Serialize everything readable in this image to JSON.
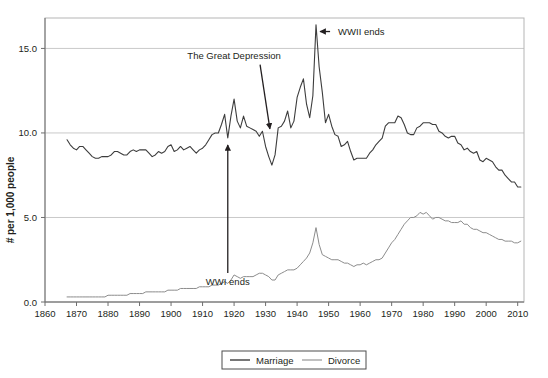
{
  "chart_data": {
    "type": "line",
    "title": "",
    "subtitle": "",
    "xlabel": "",
    "ylabel": "# per 1,000 people",
    "xlim": [
      1860,
      2012
    ],
    "ylim": [
      0.0,
      16.8
    ],
    "grid": true,
    "legend_position": "bottom-center",
    "x_ticks": [
      1860,
      1870,
      1880,
      1890,
      1900,
      1910,
      1920,
      1930,
      1940,
      1950,
      1960,
      1970,
      1980,
      1990,
      2000,
      2010
    ],
    "x_tick_labels": [
      "1860",
      "1870",
      "1880",
      "1890",
      "1900",
      "1910",
      "1920",
      "1930",
      "1940",
      "1950",
      "1960",
      "1970",
      "1980",
      "1990",
      "2000",
      "2010"
    ],
    "y_ticks": [
      0.0,
      5.0,
      10.0,
      15.0
    ],
    "y_tick_labels": [
      "0.0",
      "5.0",
      "10.0",
      "15.0"
    ],
    "legend": [
      "Marriage",
      "Divorce"
    ],
    "colors": {
      "marriage": "#3d3d3d",
      "divorce": "#8c8c8c",
      "gridline": "#c9c9c9",
      "text": "#231f20",
      "plot_border": "#b5b5b5"
    },
    "series": [
      {
        "name": "Marriage",
        "color": "#3d3d3d",
        "x": [
          1867,
          1868,
          1869,
          1870,
          1871,
          1872,
          1873,
          1874,
          1875,
          1876,
          1877,
          1878,
          1879,
          1880,
          1881,
          1882,
          1883,
          1884,
          1885,
          1886,
          1887,
          1888,
          1889,
          1890,
          1891,
          1892,
          1893,
          1894,
          1895,
          1896,
          1897,
          1898,
          1899,
          1900,
          1901,
          1902,
          1903,
          1904,
          1905,
          1906,
          1907,
          1908,
          1909,
          1910,
          1911,
          1912,
          1913,
          1914,
          1915,
          1916,
          1917,
          1918,
          1919,
          1920,
          1921,
          1922,
          1923,
          1924,
          1925,
          1926,
          1927,
          1928,
          1929,
          1930,
          1931,
          1932,
          1933,
          1934,
          1935,
          1936,
          1937,
          1938,
          1939,
          1940,
          1941,
          1942,
          1943,
          1944,
          1945,
          1946,
          1947,
          1948,
          1949,
          1950,
          1951,
          1952,
          1953,
          1954,
          1955,
          1956,
          1957,
          1958,
          1959,
          1960,
          1961,
          1962,
          1963,
          1964,
          1965,
          1966,
          1967,
          1968,
          1969,
          1970,
          1971,
          1972,
          1973,
          1974,
          1975,
          1976,
          1977,
          1978,
          1979,
          1980,
          1981,
          1982,
          1983,
          1984,
          1985,
          1986,
          1987,
          1988,
          1989,
          1990,
          1991,
          1992,
          1993,
          1994,
          1995,
          1996,
          1997,
          1998,
          1999,
          2000,
          2001,
          2002,
          2003,
          2004,
          2005,
          2006,
          2007,
          2008,
          2009,
          2010,
          2011
        ],
        "values": [
          9.6,
          9.3,
          9.1,
          9.0,
          9.2,
          9.2,
          9.0,
          8.8,
          8.6,
          8.5,
          8.5,
          8.6,
          8.6,
          8.6,
          8.7,
          8.9,
          8.9,
          8.8,
          8.7,
          8.7,
          8.9,
          9.0,
          8.9,
          9.0,
          9.0,
          9.0,
          8.8,
          8.6,
          8.7,
          8.9,
          8.8,
          8.9,
          9.2,
          9.3,
          8.9,
          9.0,
          9.2,
          9.0,
          9.1,
          9.2,
          9.0,
          8.8,
          9.0,
          9.1,
          9.3,
          9.6,
          9.9,
          10.0,
          10.0,
          10.5,
          11.1,
          9.7,
          11.0,
          12.0,
          10.7,
          10.3,
          11.0,
          10.4,
          10.3,
          10.2,
          10.1,
          9.8,
          10.1,
          9.2,
          8.6,
          8.1,
          8.7,
          10.3,
          10.4,
          10.7,
          11.3,
          10.3,
          10.7,
          12.1,
          12.7,
          13.2,
          11.7,
          10.9,
          12.2,
          16.4,
          13.9,
          12.4,
          10.6,
          11.1,
          10.4,
          9.9,
          9.8,
          9.2,
          9.3,
          9.5,
          8.9,
          8.4,
          8.5,
          8.5,
          8.5,
          8.5,
          8.8,
          9.0,
          9.3,
          9.5,
          9.7,
          10.4,
          10.6,
          10.6,
          10.6,
          11.0,
          10.9,
          10.5,
          10.0,
          9.9,
          9.9,
          10.3,
          10.4,
          10.6,
          10.6,
          10.6,
          10.5,
          10.5,
          10.1,
          10.0,
          9.8,
          9.7,
          9.8,
          9.8,
          9.4,
          9.3,
          9.0,
          9.1,
          8.9,
          8.8,
          8.9,
          8.4,
          8.3,
          8.5,
          8.4,
          8.3,
          8.0,
          7.8,
          7.8,
          7.5,
          7.3,
          7.1,
          7.1,
          6.8,
          6.8
        ]
      },
      {
        "name": "Divorce",
        "color": "#8c8c8c",
        "x": [
          1867,
          1868,
          1869,
          1870,
          1871,
          1872,
          1873,
          1874,
          1875,
          1876,
          1877,
          1878,
          1879,
          1880,
          1881,
          1882,
          1883,
          1884,
          1885,
          1886,
          1887,
          1888,
          1889,
          1890,
          1891,
          1892,
          1893,
          1894,
          1895,
          1896,
          1897,
          1898,
          1899,
          1900,
          1901,
          1902,
          1903,
          1904,
          1905,
          1906,
          1907,
          1908,
          1909,
          1910,
          1911,
          1912,
          1913,
          1914,
          1915,
          1916,
          1917,
          1918,
          1919,
          1920,
          1921,
          1922,
          1923,
          1924,
          1925,
          1926,
          1927,
          1928,
          1929,
          1930,
          1931,
          1932,
          1933,
          1934,
          1935,
          1936,
          1937,
          1938,
          1939,
          1940,
          1941,
          1942,
          1943,
          1944,
          1945,
          1946,
          1947,
          1948,
          1949,
          1950,
          1951,
          1952,
          1953,
          1954,
          1955,
          1956,
          1957,
          1958,
          1959,
          1960,
          1961,
          1962,
          1963,
          1964,
          1965,
          1966,
          1967,
          1968,
          1969,
          1970,
          1971,
          1972,
          1973,
          1974,
          1975,
          1976,
          1977,
          1978,
          1979,
          1980,
          1981,
          1982,
          1983,
          1984,
          1985,
          1986,
          1987,
          1988,
          1989,
          1990,
          1991,
          1992,
          1993,
          1994,
          1995,
          1996,
          1997,
          1998,
          1999,
          2000,
          2001,
          2002,
          2003,
          2004,
          2005,
          2006,
          2007,
          2008,
          2009,
          2010,
          2011
        ],
        "values": [
          0.3,
          0.3,
          0.3,
          0.3,
          0.3,
          0.3,
          0.3,
          0.3,
          0.3,
          0.3,
          0.3,
          0.3,
          0.3,
          0.4,
          0.4,
          0.4,
          0.4,
          0.4,
          0.4,
          0.4,
          0.5,
          0.5,
          0.5,
          0.5,
          0.5,
          0.6,
          0.6,
          0.6,
          0.6,
          0.6,
          0.6,
          0.6,
          0.7,
          0.7,
          0.7,
          0.7,
          0.8,
          0.8,
          0.8,
          0.8,
          0.8,
          0.8,
          0.9,
          0.9,
          0.9,
          0.9,
          1.0,
          1.0,
          1.0,
          1.1,
          1.2,
          1.1,
          1.3,
          1.6,
          1.5,
          1.4,
          1.5,
          1.5,
          1.5,
          1.5,
          1.6,
          1.7,
          1.7,
          1.6,
          1.5,
          1.3,
          1.3,
          1.6,
          1.7,
          1.8,
          1.9,
          1.9,
          1.9,
          2.0,
          2.2,
          2.4,
          2.6,
          2.9,
          3.5,
          4.4,
          3.4,
          2.8,
          2.7,
          2.6,
          2.5,
          2.5,
          2.5,
          2.4,
          2.3,
          2.3,
          2.2,
          2.1,
          2.2,
          2.2,
          2.3,
          2.2,
          2.3,
          2.4,
          2.5,
          2.5,
          2.6,
          2.9,
          3.2,
          3.5,
          3.7,
          4.0,
          4.3,
          4.6,
          4.8,
          5.0,
          5.0,
          5.1,
          5.3,
          5.2,
          5.3,
          5.1,
          4.9,
          5.0,
          5.0,
          4.9,
          4.8,
          4.8,
          4.7,
          4.7,
          4.7,
          4.8,
          4.6,
          4.6,
          4.4,
          4.3,
          4.3,
          4.2,
          4.1,
          4.1,
          4.0,
          3.9,
          3.8,
          3.7,
          3.7,
          3.6,
          3.6,
          3.6,
          3.5,
          3.5,
          3.6
        ]
      }
    ],
    "annotations": [
      {
        "id": "wwi-ends",
        "label": "WWI ends",
        "text_x": 1919,
        "text_y": 1.0,
        "target_x": 1918,
        "target_y": 9.7,
        "arrow": "up"
      },
      {
        "id": "great-depression",
        "label": "The Great Depression",
        "text_x": 1920,
        "text_y": 14.4,
        "target_x": 1932,
        "target_y": 10.0,
        "arrow": "down-right"
      },
      {
        "id": "wwii-ends",
        "label": "WWII ends",
        "text_x": 1953,
        "text_y": 16.0,
        "target_x": 1946,
        "target_y": 16.4,
        "arrow": "left"
      }
    ]
  }
}
